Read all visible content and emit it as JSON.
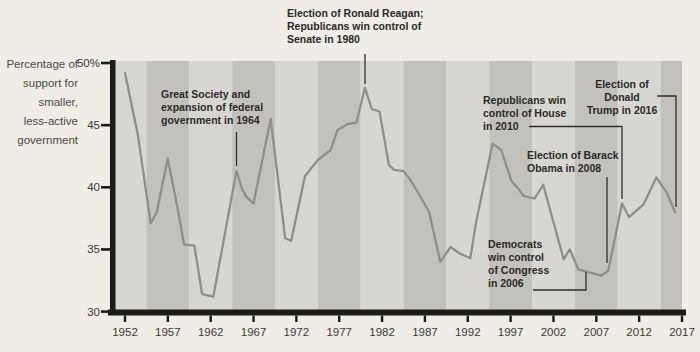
{
  "colors": {
    "page_background": "#f0ece6",
    "stripe_light": "#d8d6d1",
    "stripe_dark": "#c3c1bc",
    "data_line": "#8e8e8a",
    "axis": "#1c1b19",
    "tick_label": "#3b3a37",
    "annotation_text": "#2b2a27",
    "connector_line": "#2f2e2c"
  },
  "chart_data": {
    "type": "line",
    "title": "",
    "ylabel": "Percentage of support for smaller, less-active government",
    "ylabel_lines": "Percentage of\nsupport for\nsmaller,\nless-active\ngovernment",
    "xlim": [
      1952,
      2017
    ],
    "ylim": [
      30,
      50
    ],
    "grid": "off",
    "background_bands": "alternating 5-year vertical stripes centered on x ticks",
    "y_ticks": [
      {
        "label": "50%",
        "value": 50
      },
      {
        "label": "45",
        "value": 45
      },
      {
        "label": "40",
        "value": 40
      },
      {
        "label": "35",
        "value": 35
      },
      {
        "label": "30",
        "value": 30
      }
    ],
    "x_ticks": [
      {
        "label": "1952",
        "value": 1952
      },
      {
        "label": "1957",
        "value": 1957
      },
      {
        "label": "1962",
        "value": 1962
      },
      {
        "label": "1967",
        "value": 1967
      },
      {
        "label": "1972",
        "value": 1972
      },
      {
        "label": "1977",
        "value": 1977
      },
      {
        "label": "1982",
        "value": 1982
      },
      {
        "label": "1987",
        "value": 1987
      },
      {
        "label": "1992",
        "value": 1992
      },
      {
        "label": "1997",
        "value": 1997
      },
      {
        "label": "2002",
        "value": 2002
      },
      {
        "label": "2007",
        "value": 2007
      },
      {
        "label": "2012",
        "value": 2012
      },
      {
        "label": "2017",
        "value": 2017
      }
    ],
    "series": [
      {
        "name": "support-for-smaller-government",
        "x": [
          1952,
          1953.5,
          1955,
          1955.7,
          1957,
          1958.2,
          1958.9,
          1960.1,
          1961,
          1962.3,
          1965,
          1965.7,
          1966.2,
          1967,
          1969,
          1970.7,
          1971.4,
          1973,
          1974.5,
          1976,
          1976.8,
          1978,
          1979,
          1980,
          1980.8,
          1981.7,
          1982.8,
          1983.4,
          1984.5,
          1985.2,
          1986,
          1987.5,
          1988.8,
          1990,
          1991,
          1992.3,
          1993,
          1994.9,
          1995.9,
          1997.1,
          1998,
          1998.5,
          1999.8,
          2000.8,
          2003.2,
          2003.9,
          2004.9,
          2006,
          2007.6,
          2008.4,
          2010,
          2010.8,
          2012.5,
          2014,
          2015.2,
          2016.2
        ],
        "y": [
          49.2,
          44.2,
          37.1,
          38.0,
          42.3,
          38.1,
          35.4,
          35.3,
          31.4,
          31.2,
          41.3,
          39.8,
          39.2,
          38.7,
          45.5,
          35.9,
          35.7,
          40.9,
          42.2,
          43.0,
          44.6,
          45.1,
          45.2,
          48.0,
          46.3,
          46.1,
          41.8,
          41.4,
          41.3,
          40.7,
          39.8,
          38.0,
          34.0,
          35.2,
          34.7,
          34.3,
          37.3,
          43.5,
          43.0,
          40.5,
          39.8,
          39.3,
          39.1,
          40.2,
          34.2,
          35.0,
          33.4,
          33.2,
          32.9,
          33.3,
          38.7,
          37.6,
          38.6,
          40.8,
          39.6,
          38.0
        ]
      }
    ],
    "annotations": {
      "great_society": {
        "text": "Great Society and\nexpansion of federal\ngovernment in 1964"
      },
      "reagan": {
        "text": "Election of Ronald Reagan;\nRepublicans win control of\nSenate in 1980"
      },
      "repub_house": {
        "text": "Republicans win\ncontrol of House\nin 2010"
      },
      "obama": {
        "text": "Election of Barack\nObama in 2008"
      },
      "trump": {
        "text": "Election of Donald\nTrump in 2016"
      },
      "dems_congress": {
        "text": "Democrats\nwin control\nof Congress\nin 2006"
      }
    }
  }
}
